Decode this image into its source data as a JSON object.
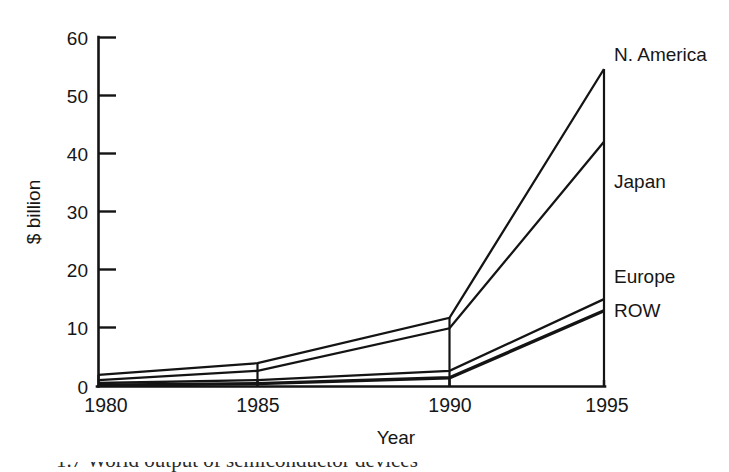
{
  "chart_data": {
    "type": "area",
    "title": "",
    "subtitle": "",
    "xlabel": "Year",
    "ylabel": "$ billion",
    "x": [
      1980,
      1985,
      1990,
      1995
    ],
    "xtick_labels": [
      "1980",
      "1985",
      "1990",
      "1995"
    ],
    "ytick_labels": [
      "0",
      "10",
      "20",
      "30",
      "40",
      "50",
      "60"
    ],
    "yticks": [
      0,
      10,
      20,
      30,
      40,
      50,
      60
    ],
    "ylim": [
      0,
      60
    ],
    "xlim": [
      1980,
      1995
    ],
    "grid": false,
    "legend_position": "right-inline-labels",
    "stacked": true,
    "series": [
      {
        "name": "ROW",
        "values": [
          0.2,
          0.5,
          1.5,
          13.0
        ]
      },
      {
        "name": "Europe",
        "values": [
          0.4,
          0.6,
          1.2,
          2.0
        ]
      },
      {
        "name": "Japan",
        "values": [
          0.5,
          1.6,
          7.3,
          27.0
        ]
      },
      {
        "name": "N. America",
        "values": [
          0.9,
          1.3,
          1.8,
          12.5
        ]
      }
    ],
    "cumulative_tops": {
      "ROW": [
        0.2,
        0.5,
        1.5,
        13.0
      ],
      "Europe": [
        0.6,
        1.1,
        2.7,
        15.0
      ],
      "Japan": [
        1.1,
        2.7,
        10.0,
        42.0
      ],
      "N. America": [
        2.0,
        4.0,
        11.8,
        54.5
      ]
    },
    "series_labels": [
      "N. America",
      "Japan",
      "Europe",
      "ROW"
    ],
    "colors": {
      "line": "#141414",
      "background": "#ffffff"
    }
  },
  "caption": {
    "text": "1.7   World output of semiconductor devices"
  }
}
